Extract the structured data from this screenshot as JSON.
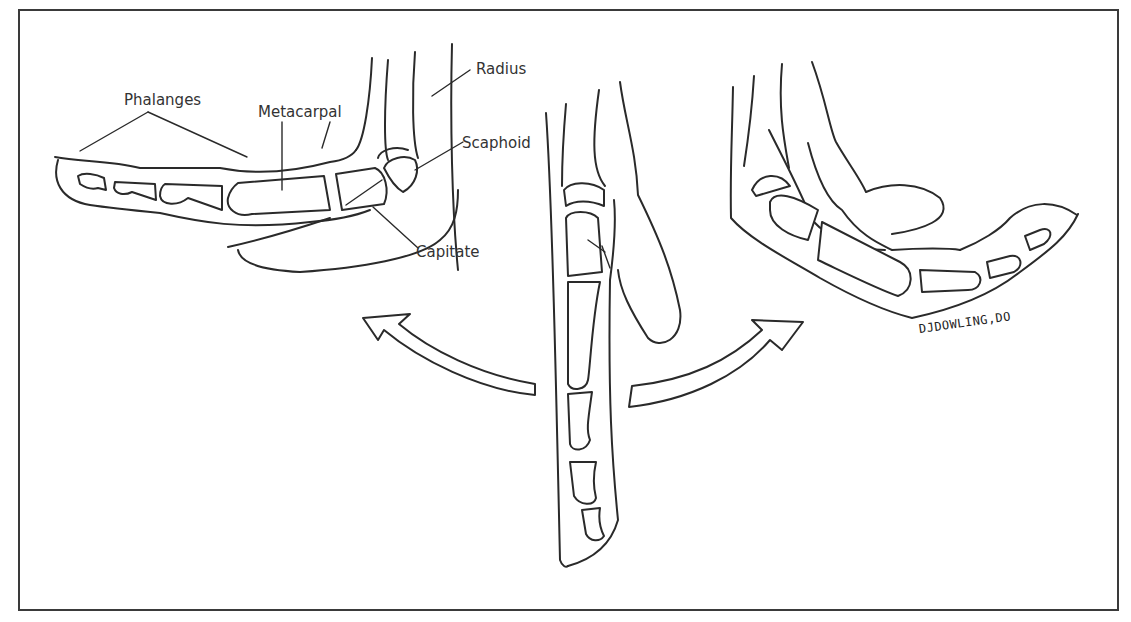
{
  "figure": {
    "labels": {
      "phalanges": "Phalanges",
      "metacarpal": "Metacarpal",
      "radius": "Radius",
      "scaphoid": "Scaphoid",
      "capitate": "Capitate"
    },
    "signature": "DJDOWLING,DO",
    "panels": [
      {
        "id": "extension",
        "position": "left"
      },
      {
        "id": "neutral",
        "position": "center"
      },
      {
        "id": "flexion",
        "position": "right"
      }
    ],
    "arrows": [
      {
        "direction": "up-left"
      },
      {
        "direction": "up-right"
      }
    ],
    "colors": {
      "line": "#2a2a2a",
      "text": "#333333",
      "background": "#ffffff",
      "frame": "#3a3a3a"
    }
  }
}
